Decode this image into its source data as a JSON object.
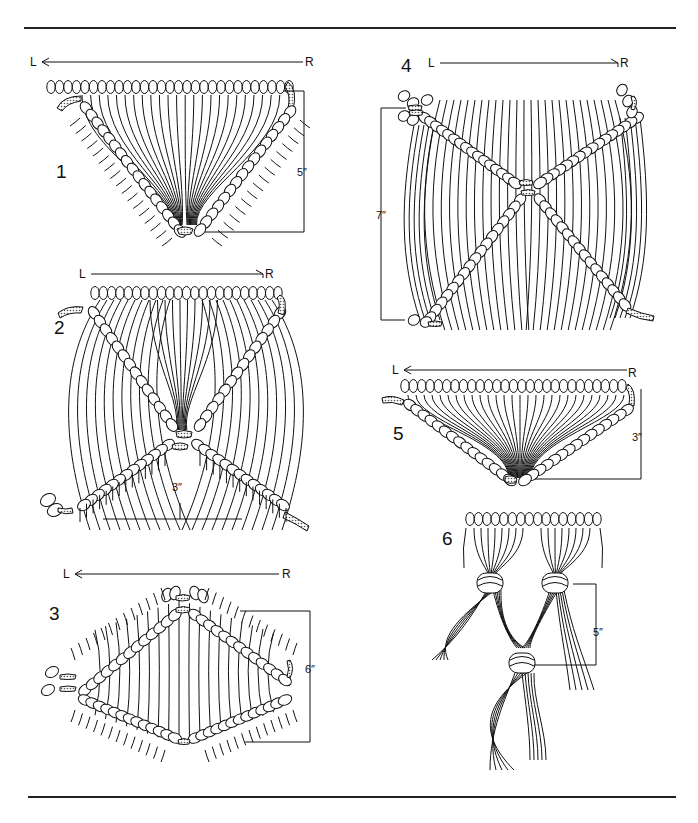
{
  "page": {
    "type": "macrame technique diagram",
    "background": "#ffffff",
    "ink": "#111111"
  },
  "figures": [
    {
      "number": "1",
      "direction": {
        "from": "R",
        "to": "L"
      },
      "dimension": "5″",
      "shape": "inverted triangle of diagonal half hitches"
    },
    {
      "number": "2",
      "direction": {
        "from": "L",
        "to": "R"
      },
      "dimension": "3″",
      "shape": "crossed diagonals (X) with fanned cords"
    },
    {
      "number": "3",
      "direction": {
        "from": "R",
        "to": "L"
      },
      "dimension": "6″",
      "shape": "diamond of double half hitches"
    },
    {
      "number": "4",
      "direction": {
        "from": "L",
        "to": "R"
      },
      "dimension": "7″",
      "shape": "X of diagonal half hitches"
    },
    {
      "number": "5",
      "direction": {
        "from": "R",
        "to": "L"
      },
      "dimension": "3″",
      "shape": "shallow inverted triangle"
    },
    {
      "number": "6",
      "direction": null,
      "dimension": "5″",
      "shape": "alternating gathering knots"
    }
  ],
  "labels": {
    "L": "L",
    "R": "R",
    "fig1": "1",
    "fig2": "2",
    "fig3": "3",
    "fig4": "4",
    "fig5": "5",
    "fig6": "6",
    "dim1": "5″",
    "dim2": "3″",
    "dim3": "6″",
    "dim4": "7″",
    "dim5": "3″",
    "dim6": "5″"
  }
}
